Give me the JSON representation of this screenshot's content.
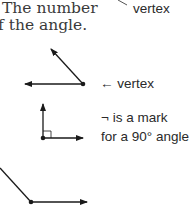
{
  "text": {
    "line1": "The number",
    "line2": "f the angle."
  },
  "labels": {
    "top_vertex": "vertex",
    "angle_vertex": "← vertex",
    "right_mark_line1": "¬ is a mark",
    "right_mark_line2": "for a 90° angle."
  },
  "figures": [
    {
      "name": "top-ray-fragment",
      "type": "line"
    },
    {
      "name": "obtuse-angle",
      "vertex": [
        83,
        84
      ],
      "rays": [
        [
          50,
          48
        ],
        [
          25,
          84
        ]
      ]
    },
    {
      "name": "right-angle",
      "vertex": [
        43,
        138
      ],
      "rays": [
        [
          43,
          103
        ],
        [
          83,
          138
        ]
      ],
      "mark": "square"
    },
    {
      "name": "bottom-angle",
      "vertex": [
        31,
        202
      ],
      "rays": [
        [
          0,
          168
        ],
        [
          87,
          202
        ]
      ]
    }
  ],
  "colors": {
    "ink": "#1a1a1a",
    "text": "#3a3a3a"
  }
}
